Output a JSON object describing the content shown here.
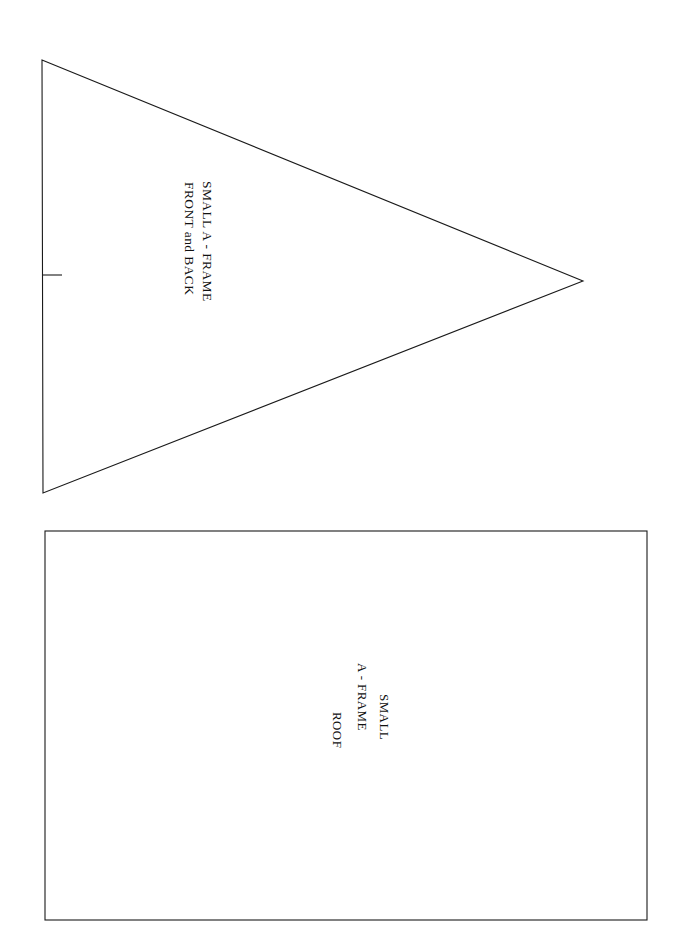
{
  "page": {
    "background_color": "#ffffff",
    "ink_color": "#1a1a1a",
    "width": 682,
    "height": 949,
    "orientation": "text rotated 90 degrees clockwise (landscape content on portrait page)"
  },
  "shapes": {
    "triangle": {
      "name": "a-frame-front-back-pattern",
      "stroke_color": "#1a1a1a",
      "stroke_width": 1.1,
      "fill": "none",
      "points": "42,60 583,281 43,493",
      "vertices": [
        {
          "label": "top-left",
          "x": 42,
          "y": 60
        },
        {
          "label": "apex-right",
          "x": 583,
          "y": 281
        },
        {
          "label": "bottom-left",
          "x": 43,
          "y": 493
        }
      ],
      "tick_mark": {
        "name": "center-tick",
        "x1": 43,
        "y1": 275,
        "x2": 62,
        "y2": 275
      }
    },
    "rectangle": {
      "name": "a-frame-roof-pattern",
      "stroke_color": "#1a1a1a",
      "stroke_width": 1.1,
      "fill": "none",
      "x": 45,
      "y": 531,
      "width": 602,
      "height": 389
    }
  },
  "labels": {
    "a_frame": {
      "line1": "SMALL A - FRAME",
      "line2": "FRONT and BACK"
    },
    "roof": {
      "line1": "SMALL",
      "line2": "A - FRAME",
      "line3": "ROOF"
    }
  }
}
